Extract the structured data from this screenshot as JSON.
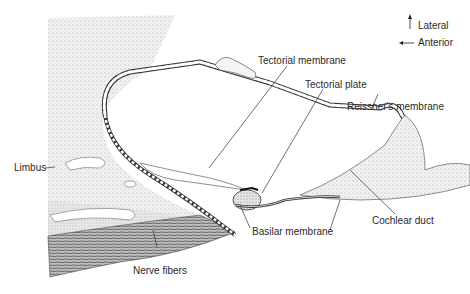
{
  "header": {
    "page_fragment_left": "CHAPTER",
    "page_fragment_right": "123"
  },
  "orientation": {
    "up_label": "Lateral",
    "left_label": "Anterior"
  },
  "labels": {
    "tectorial_membrane": "Tectorial membrane",
    "tectorial_plate": "Tectorial plate",
    "reissners_membrane": "Reissner's membrane",
    "limbus": "Limbus",
    "cochlear_duct": "Cochlear duct",
    "basilar_membrane": "Basilar membrane",
    "nerve_fibers": "Nerve fibers"
  },
  "colors": {
    "ink": "#2a2a2a",
    "stipple": "#d8d8d8",
    "dark_fibers": "#555555",
    "background": "#ffffff"
  }
}
